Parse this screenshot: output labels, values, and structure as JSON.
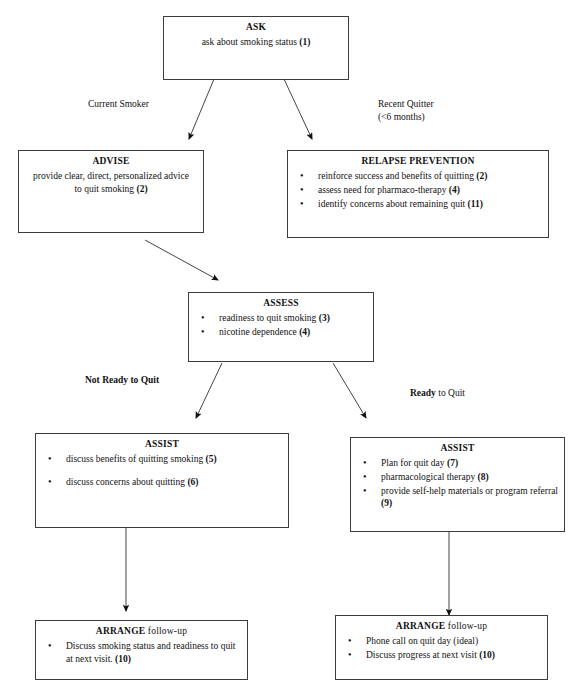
{
  "diagram": {
    "line_color": "#3c3c3c",
    "text_color": "#111111",
    "background": "#ffffff"
  },
  "nodes": {
    "ask": {
      "title": "ASK",
      "body": "ask about smoking status (1)",
      "body_plain": "ask about smoking status",
      "ref": "(1)"
    },
    "advise": {
      "title": "ADVISE",
      "body": "provide clear, direct, personalized advice to quit smoking (2)",
      "line1": "provide clear, direct, personalized advice",
      "line2": "to quit smoking",
      "ref": "(2)"
    },
    "relapse_prevention": {
      "title": "RELAPSE PREVENTION",
      "items": [
        {
          "text": "reinforce success and benefits of quitting",
          "ref": "(2)"
        },
        {
          "text": "assess need for pharmaco-therapy",
          "ref": "(4)"
        },
        {
          "text": "identify concerns about remaining quit",
          "ref": "(11)"
        }
      ]
    },
    "assess": {
      "title": "ASSESS",
      "items": [
        {
          "text": "readiness to quit smoking",
          "ref": "(3)"
        },
        {
          "text": "nicotine dependence",
          "ref": "(4)"
        }
      ]
    },
    "assist_not_ready": {
      "title": "ASSIST",
      "items": [
        {
          "text": "discuss benefits of quitting smoking",
          "ref": "(5)"
        },
        {
          "text": "discuss concerns about quitting",
          "ref": "(6)"
        }
      ]
    },
    "assist_ready": {
      "title": "ASSIST",
      "items": [
        {
          "text": "Plan for quit day",
          "ref": "(7)"
        },
        {
          "text": "pharmacological therapy",
          "ref": "(8)"
        },
        {
          "text": "provide self-help materials or program referral",
          "ref": "(9)"
        }
      ]
    },
    "arrange_left": {
      "title_bold": "ARRANGE",
      "title_rest": " follow-up",
      "items": [
        {
          "text": "Discuss smoking status and readiness to quit at next visit.",
          "ref": "(10)"
        }
      ]
    },
    "arrange_right": {
      "title_bold": "ARRANGE",
      "title_rest": " follow-up",
      "items": [
        {
          "text": "Phone call on quit day (ideal)",
          "ref": ""
        },
        {
          "text": "Discuss progress at next visit",
          "ref": "(10)"
        }
      ]
    }
  },
  "edge_labels": {
    "current_smoker": "Current Smoker",
    "recent_quitter": "Recent Quitter\n(<6 months)",
    "not_ready_to_quit": "Not Ready to Quit",
    "ready_to_quit_bold": "Ready",
    "ready_to_quit_rest": " to Quit"
  }
}
